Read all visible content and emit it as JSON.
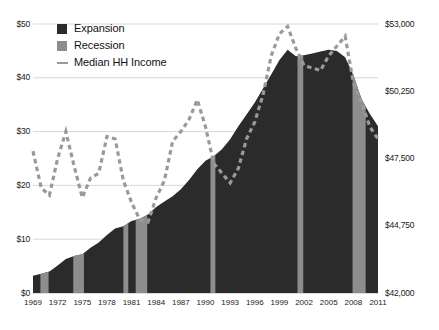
{
  "legend": {
    "position": "top-left-inside",
    "items": [
      {
        "label": "Expansion",
        "marker": "square-swatch-icon",
        "color": "#2b2b2b"
      },
      {
        "label": "Recession",
        "marker": "square-swatch-icon",
        "color": "#8d8d8d"
      },
      {
        "label": "Median HH Income",
        "marker": "dashed-line-icon",
        "color": "#9a9a9a"
      }
    ]
  },
  "chart_data": {
    "type": "area",
    "title": "",
    "xlabel": "",
    "ylabel": "",
    "grid": true,
    "x": [
      1969,
      1970,
      1971,
      1972,
      1973,
      1974,
      1975,
      1976,
      1977,
      1978,
      1979,
      1980,
      1981,
      1982,
      1983,
      1984,
      1985,
      1986,
      1987,
      1988,
      1989,
      1990,
      1991,
      1992,
      1993,
      1994,
      1995,
      1996,
      1997,
      1998,
      1999,
      2000,
      2001,
      2002,
      2003,
      2004,
      2005,
      2006,
      2007,
      2008,
      2009,
      2010,
      2011
    ],
    "xlim": [
      1969,
      2011
    ],
    "xticks": [
      1969,
      1972,
      1975,
      1978,
      1981,
      1984,
      1987,
      1990,
      1993,
      1996,
      1999,
      2002,
      2005,
      2008,
      2011
    ],
    "xtick_labels": [
      "1969",
      "1972",
      "1975",
      "1978",
      "1981",
      "1984",
      "1987",
      "1990",
      "1993",
      "1996",
      "1999",
      "2002",
      "2005",
      "2008",
      "2011"
    ],
    "left_axis": {
      "ylim": [
        0,
        50
      ],
      "ticks": [
        0,
        10,
        20,
        30,
        40,
        50
      ],
      "tick_labels": [
        "$0",
        "$10",
        "$20",
        "$30",
        "$40",
        "$50"
      ]
    },
    "right_axis": {
      "ylim": [
        42000,
        53000
      ],
      "ticks": [
        42000,
        44750,
        47500,
        50250,
        53000
      ],
      "tick_labels": [
        "$42,000",
        "$44,750",
        "$47,500",
        "$50,250",
        "$53,000"
      ]
    },
    "series": [
      {
        "name": "Expansion",
        "type": "area",
        "axis": "left",
        "color": "#2b2b2b",
        "values": [
          3.2,
          3.6,
          4.0,
          5.1,
          6.3,
          6.9,
          7.2,
          8.4,
          9.4,
          10.8,
          12.0,
          12.4,
          13.4,
          13.8,
          14.6,
          16.0,
          17.0,
          18.0,
          19.3,
          21.0,
          23.0,
          24.6,
          25.4,
          26.7,
          28.6,
          31.0,
          33.2,
          35.4,
          38.0,
          40.6,
          43.3,
          45.2,
          44.0,
          44.2,
          44.5,
          44.9,
          45.2,
          45.0,
          43.8,
          40.5,
          36.0,
          33.3,
          31.0
        ]
      },
      {
        "name": "Median HH Income",
        "type": "line",
        "style": "dashed",
        "axis": "right",
        "color": "#9a9a9a",
        "values": [
          47800,
          46300,
          46000,
          47500,
          48600,
          47200,
          45900,
          46700,
          46900,
          48400,
          48300,
          46600,
          45700,
          45000,
          44900,
          45900,
          46600,
          48200,
          48600,
          49100,
          49900,
          48800,
          47300,
          46900,
          46500,
          47100,
          48300,
          49000,
          50100,
          51700,
          52600,
          52900,
          52000,
          51300,
          51200,
          51100,
          51700,
          52100,
          52500,
          50600,
          49800,
          48800,
          48300
        ]
      }
    ],
    "recession_bands": [
      {
        "start": 1969.9,
        "end": 1970.9
      },
      {
        "start": 1973.9,
        "end": 1975.2
      },
      {
        "start": 1980.0,
        "end": 1980.6
      },
      {
        "start": 1981.5,
        "end": 1982.9
      },
      {
        "start": 1990.6,
        "end": 1991.2
      },
      {
        "start": 2001.2,
        "end": 2001.9
      },
      {
        "start": 2007.9,
        "end": 2009.5
      }
    ]
  }
}
